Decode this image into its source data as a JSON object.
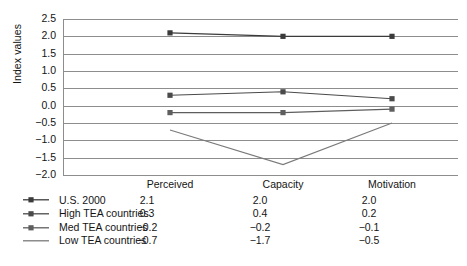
{
  "chart_data": {
    "type": "line",
    "title": "",
    "xlabel": "",
    "ylabel": "Index values",
    "categories": [
      "Perceived",
      "Capacity",
      "Motivation"
    ],
    "ylim": [
      -2.0,
      2.5
    ],
    "ytick_labels": [
      "2.5",
      "2.0",
      "1.5",
      "1.0",
      "0.5",
      "0.0",
      "-0.5",
      "-1.0",
      "-1.5",
      "-2.0"
    ],
    "ytick_values": [
      2.5,
      2.0,
      1.5,
      1.0,
      0.5,
      0.0,
      -0.5,
      -1.0,
      -1.5,
      -2.0
    ],
    "grid": true,
    "legend_position": "below-left",
    "series": [
      {
        "name": "U.S. 2000",
        "values": [
          2.1,
          2.0,
          2.0
        ],
        "display": [
          "2.1",
          "2.0",
          "2.0"
        ],
        "color": "#3b3b3b",
        "marker": "square"
      },
      {
        "name": "High TEA countries",
        "values": [
          0.3,
          0.4,
          0.2
        ],
        "display": [
          "0.3",
          "0.4",
          "0.2"
        ],
        "color": "#4a4a4a",
        "marker": "square"
      },
      {
        "name": "Med TEA countries",
        "values": [
          -0.2,
          -0.2,
          -0.1
        ],
        "display": [
          "-0.2",
          "-0.2",
          "-0.1"
        ],
        "color": "#5e5e5e",
        "marker": "square"
      },
      {
        "name": "Low TEA countries",
        "values": [
          -0.7,
          -1.7,
          -0.5
        ],
        "display": [
          "-0.7",
          "-1.7",
          "-0.5"
        ],
        "color": "#7a7a7a",
        "marker": "none"
      }
    ]
  }
}
